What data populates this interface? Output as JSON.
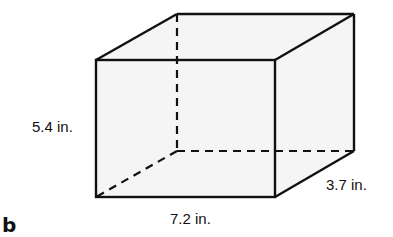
{
  "figure": {
    "type": "rectangular-prism",
    "label": "b",
    "dimensions": {
      "height": "5.4 in.",
      "length": "7.2 in.",
      "depth": "3.7 in."
    },
    "colors": {
      "edge": "#111111",
      "face_fill": "#f5f5f5",
      "background": "#ffffff"
    },
    "vertices": {
      "front_top_left": [
        96,
        60
      ],
      "front_top_right": [
        275,
        60
      ],
      "front_bottom_left": [
        96,
        197
      ],
      "front_bottom_right": [
        275,
        197
      ],
      "back_top_left": [
        177,
        14
      ],
      "back_top_right": [
        354,
        14
      ],
      "back_bottom_left": [
        177,
        151
      ],
      "back_bottom_right": [
        354,
        151
      ]
    }
  }
}
